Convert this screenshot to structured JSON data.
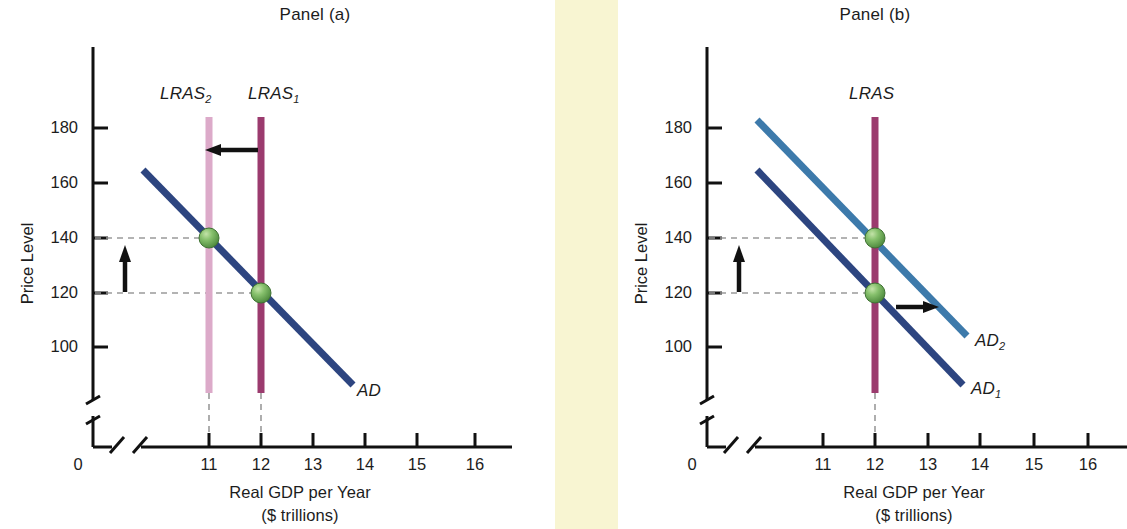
{
  "figure": {
    "background_color": "#ffffff",
    "divider_strip": {
      "color": "#f8f5d2",
      "x": 555,
      "width": 63
    }
  },
  "panels": [
    {
      "id": "a",
      "title": "Panel (a)",
      "x_axis_title_line1": "Real GDP per Year",
      "x_axis_title_line2": "($ trillions)",
      "y_axis_title": "Price Level",
      "origin_label": "0",
      "y_ticks": [
        "180",
        "160",
        "140",
        "120",
        "100"
      ],
      "x_ticks": [
        "11",
        "12",
        "13",
        "14",
        "15",
        "16"
      ],
      "curve_labels": {
        "lras2": "LRAS",
        "lras2_sub": "2",
        "lras1": "LRAS",
        "lras1_sub": "1",
        "ad": "AD"
      }
    },
    {
      "id": "b",
      "title": "Panel (b)",
      "x_axis_title_line1": "Real GDP per Year",
      "x_axis_title_line2": "($ trillions)",
      "y_axis_title": "Price Level",
      "origin_label": "0",
      "y_ticks": [
        "180",
        "160",
        "140",
        "120",
        "100"
      ],
      "x_ticks": [
        "11",
        "12",
        "13",
        "14",
        "15",
        "16"
      ],
      "curve_labels": {
        "lras": "LRAS",
        "ad2": "AD",
        "ad2_sub": "2",
        "ad1": "AD",
        "ad1_sub": "1"
      }
    }
  ],
  "chart_data": [
    {
      "type": "line",
      "title": "Panel (a)",
      "xlabel": "Real GDP per Year ($ trillions)",
      "ylabel": "Price Level",
      "xlim": [
        10.3,
        16.7
      ],
      "ylim": [
        88,
        190
      ],
      "xticks": [
        11,
        12,
        13,
        14,
        15,
        16
      ],
      "yticks": [
        100,
        120,
        140,
        160,
        180
      ],
      "grid": false,
      "axis_break_x": true,
      "axis_break_y": true,
      "legend": "inline-labels",
      "series": [
        {
          "name": "AD",
          "label": "AD",
          "color": "#2d4580",
          "type": "downward-sloping-line",
          "points": [
            [
              10.8,
              164
            ],
            [
              13.8,
              92
            ]
          ]
        },
        {
          "name": "LRAS2",
          "label": "LRAS₂",
          "color": "#dcaac9",
          "type": "vertical-line",
          "x": 11,
          "y_range": [
            84,
            182
          ]
        },
        {
          "name": "LRAS1",
          "label": "LRAS₁",
          "color": "#9b3b6e",
          "type": "vertical-line",
          "x": 12,
          "y_range": [
            84,
            182
          ]
        }
      ],
      "equilibria": [
        {
          "x": 11,
          "y": 140,
          "color": "#6aab5a",
          "note": "new equilibrium after LRAS shifts left"
        },
        {
          "x": 12,
          "y": 120,
          "color": "#6aab5a",
          "note": "initial equilibrium"
        }
      ],
      "dashed_guides": [
        {
          "orientation": "horizontal",
          "y": 140,
          "from_x": 10.15,
          "to_x": 11
        },
        {
          "orientation": "horizontal",
          "y": 120,
          "from_x": 10.15,
          "to_x": 12
        },
        {
          "orientation": "vertical",
          "x": 11,
          "from_y": 84,
          "to_y": 92
        },
        {
          "orientation": "vertical",
          "x": 12,
          "from_y": 84,
          "to_y": 92
        }
      ],
      "annotations": [
        {
          "kind": "arrow",
          "direction": "left",
          "from_x": 12,
          "to_x": 11.15,
          "y": 173,
          "note": "LRAS shifts leftward"
        },
        {
          "kind": "arrow",
          "direction": "up",
          "x": 10.65,
          "from_y": 121,
          "to_y": 141,
          "note": "price level rises"
        }
      ]
    },
    {
      "type": "line",
      "title": "Panel (b)",
      "xlabel": "Real GDP per Year ($ trillions)",
      "ylabel": "Price Level",
      "xlim": [
        10.3,
        16.7
      ],
      "ylim": [
        88,
        190
      ],
      "xticks": [
        11,
        12,
        13,
        14,
        15,
        16
      ],
      "yticks": [
        100,
        120,
        140,
        160,
        180
      ],
      "grid": false,
      "axis_break_x": true,
      "axis_break_y": true,
      "legend": "inline-labels",
      "series": [
        {
          "name": "AD1",
          "label": "AD₁",
          "color": "#2d4580",
          "type": "downward-sloping-line",
          "points": [
            [
              10.8,
              164
            ],
            [
              13.8,
              92
            ]
          ]
        },
        {
          "name": "AD2",
          "label": "AD₂",
          "color": "#3d7aab",
          "type": "downward-sloping-line",
          "points": [
            [
              10.8,
              184
            ],
            [
              13.9,
              105
            ]
          ]
        },
        {
          "name": "LRAS",
          "label": "LRAS",
          "color": "#9b3b6e",
          "type": "vertical-line",
          "x": 12,
          "y_range": [
            84,
            182
          ]
        }
      ],
      "equilibria": [
        {
          "x": 12,
          "y": 140,
          "color": "#6aab5a",
          "note": "new equilibrium after AD shifts right"
        },
        {
          "x": 12,
          "y": 120,
          "color": "#6aab5a",
          "note": "initial equilibrium"
        }
      ],
      "dashed_guides": [
        {
          "orientation": "horizontal",
          "y": 140,
          "from_x": 10.15,
          "to_x": 12
        },
        {
          "orientation": "horizontal",
          "y": 120,
          "from_x": 10.15,
          "to_x": 12
        },
        {
          "orientation": "vertical",
          "x": 12,
          "from_y": 84,
          "to_y": 92
        }
      ],
      "annotations": [
        {
          "kind": "arrow",
          "direction": "right",
          "from_x": 12.4,
          "to_x": 13.15,
          "y": 117,
          "note": "AD shifts rightward"
        },
        {
          "kind": "arrow",
          "direction": "up",
          "x": 10.65,
          "from_y": 121,
          "to_y": 141,
          "note": "price level rises"
        }
      ]
    }
  ]
}
